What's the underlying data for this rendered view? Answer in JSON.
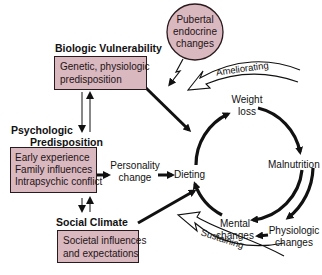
{
  "diagram": {
    "colors": {
      "box_fill": "#d9b8bf",
      "stroke": "#111111",
      "background": "#ffffff"
    },
    "headings": {
      "biologic": "Biologic Vulnerability",
      "psychologic_line1": "Psychologic",
      "psychologic_line2": "Predisposition",
      "social": "Social Climate"
    },
    "boxes": {
      "biologic": {
        "line1": "Genetic, physiologic",
        "line2": "predisposition"
      },
      "psychologic": {
        "line1": "Early experience",
        "line2": "Family influences",
        "line3": "Intrapsychic conflict"
      },
      "social": {
        "line1": "Societal influences",
        "line2": "and expectations"
      }
    },
    "pubertal": {
      "line1": "Pubertal",
      "line2": "endocrine",
      "line3": "changes"
    },
    "nodes": {
      "personality_line1": "Personality",
      "personality_line2": "change",
      "dieting": "Dieting",
      "weight_line1": "Weight",
      "weight_line2": "loss",
      "malnutrition": "Malnutrition",
      "mental_line1": "Mental",
      "mental_line2": "changes",
      "physiologic_line1": "Physiologic",
      "physiologic_line2": "changes"
    },
    "feedback_arrows": {
      "ameliorating": "Ameliorating",
      "sustaining": "Sustaining"
    }
  }
}
